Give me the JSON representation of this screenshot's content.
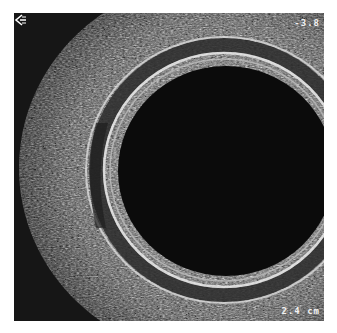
{
  "image": {
    "type": "ultrasound-scan",
    "border_color": "#ffffff",
    "background_color": "#1a1a1a",
    "lumen_color": "#0a0a0a",
    "tissue_color": "#bdbdbd"
  },
  "annotations": {
    "depth_label": "-3.8",
    "scale_label": "2.4 cm",
    "arrow_direction": "left"
  }
}
